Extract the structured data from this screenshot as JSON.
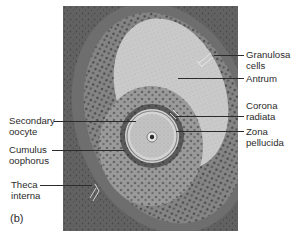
{
  "figure": {
    "panel_label": "(b)",
    "labels_right": [
      {
        "line1": "Granulosa",
        "line2": "cells"
      },
      {
        "line1": "Antrum",
        "line2": ""
      },
      {
        "line1": "Corona",
        "line2": "radiata"
      },
      {
        "line1": "Zona",
        "line2": "pellucida"
      }
    ],
    "labels_left": [
      {
        "line1": "Secondary",
        "line2": "oocyte"
      },
      {
        "line1": "Cumulus",
        "line2": "oophorus"
      },
      {
        "line1": "Theca",
        "line2": "interna"
      }
    ]
  },
  "colors": {
    "stroma": "#5e5e5e",
    "granulosa": "#7a7a7a",
    "antrum": "#c9c9c9",
    "oocyte": "#bdbdbd",
    "text": "#2b2b2b"
  }
}
